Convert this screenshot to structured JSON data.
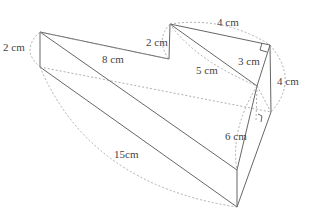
{
  "diagram": {
    "type": "geometry-solid",
    "labels": {
      "left_height": "2 cm",
      "top_left_edge": "8 cm",
      "mid_height": "2 cm",
      "top_right_edge": "4 cm",
      "hypotenuse": "5 cm",
      "short_leg": "3 cm",
      "right_height": "4 cm",
      "lower_leg": "6 cm",
      "long_edge": "15cm"
    },
    "colors": {
      "line": "#555555",
      "dashed": "#9a9a9a",
      "text": "#444444"
    }
  }
}
